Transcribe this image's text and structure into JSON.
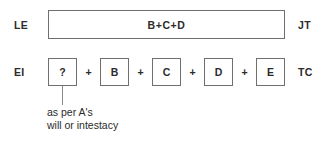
{
  "diagram": {
    "colors": {
      "box_border": "#6f6f6f",
      "connector": "#8a8a8a",
      "text": "#2b2b2b",
      "background": "#ffffff"
    },
    "row1": {
      "left_label": "LE",
      "right_label": "JT",
      "box_text": "B+C+D"
    },
    "row2": {
      "left_label": "EI",
      "right_label": "TC",
      "separator": "+",
      "boxes": [
        {
          "label": "?"
        },
        {
          "label": "B"
        },
        {
          "label": "C"
        },
        {
          "label": "D"
        },
        {
          "label": "E"
        }
      ]
    },
    "annotation": {
      "line1": "as per A's",
      "line2": "will or intestacy"
    }
  }
}
